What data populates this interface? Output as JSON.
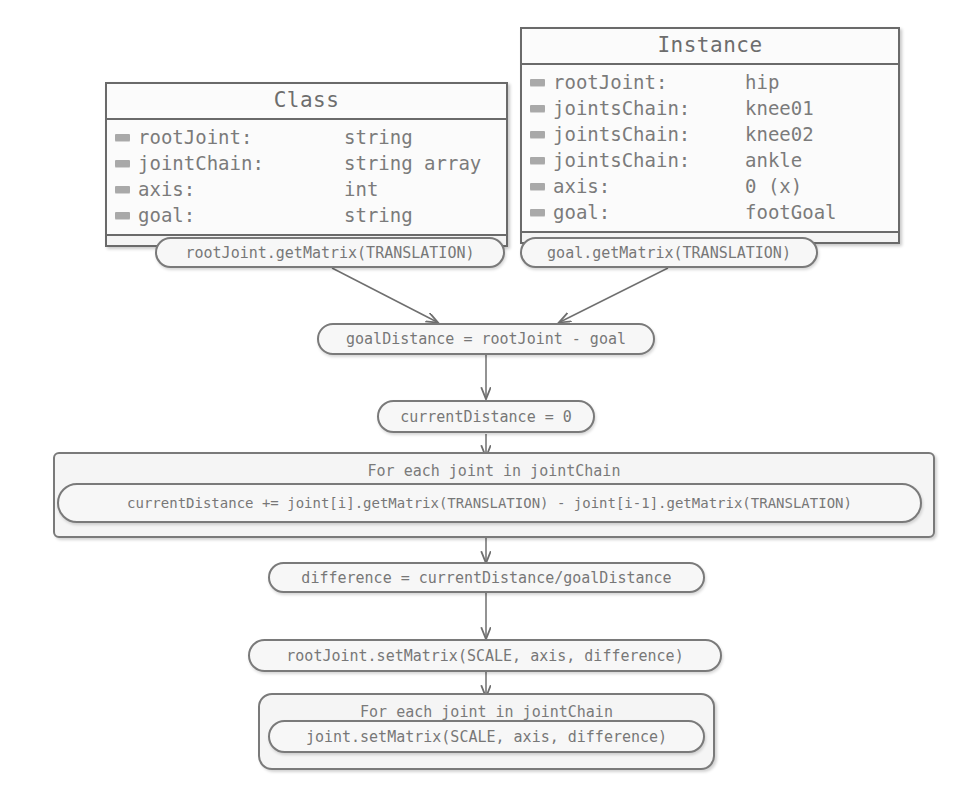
{
  "diagram": {
    "title_class": "Class",
    "title_instance": "Instance",
    "class_box": {
      "header": "Class",
      "rows": [
        {
          "icon": "attribute-icon",
          "key": "rootJoint:",
          "value": "string"
        },
        {
          "icon": "attribute-icon",
          "key": "jointChain:",
          "value": "string array"
        },
        {
          "icon": "attribute-icon",
          "key": "axis:",
          "value": "int"
        },
        {
          "icon": "attribute-icon",
          "key": "goal:",
          "value": "string"
        }
      ]
    },
    "instance_box": {
      "header": "Instance",
      "rows": [
        {
          "icon": "attribute-icon",
          "key": "rootJoint:",
          "value": "hip"
        },
        {
          "icon": "attribute-icon",
          "key": "jointsChain:",
          "value": "knee01"
        },
        {
          "icon": "attribute-icon",
          "key": "jointsChain:",
          "value": "knee02"
        },
        {
          "icon": "attribute-icon",
          "key": "jointsChain:",
          "value": "ankle"
        },
        {
          "icon": "attribute-icon",
          "key": "axis:",
          "value": "0 (x)"
        },
        {
          "icon": "attribute-icon",
          "key": "goal:",
          "value": "footGoal"
        }
      ]
    },
    "nodes": {
      "root_get_matrix": "rootJoint.getMatrix(TRANSLATION)",
      "goal_get_matrix": "goal.getMatrix(TRANSLATION)",
      "goal_distance": "goalDistance = rootJoint - goal",
      "current_distance_init": "currentDistance = 0",
      "loop_top_label": "For each joint in jointChain",
      "loop_top_body": "currentDistance += joint[i].getMatrix(TRANSLATION) - joint[i-1].getMatrix(TRANSLATION)",
      "difference": "difference = currentDistance/goalDistance",
      "root_set_matrix": "rootJoint.setMatrix(SCALE, axis, difference)",
      "loop_bottom_label": "For each joint in jointChain",
      "loop_bottom_body": "joint.setMatrix(SCALE, axis, difference)"
    },
    "colors": {
      "stroke": "#7a7a7a",
      "box_stroke": "#6a6a6a",
      "fill": "#f7f7f7",
      "text": "#777777",
      "icon": "#a9a9a9",
      "background": "#ffffff"
    }
  }
}
